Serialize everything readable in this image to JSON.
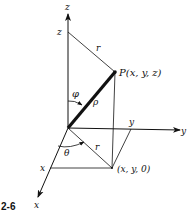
{
  "figure": {
    "number": "2-6"
  },
  "axes": {
    "z_label": "z",
    "y_label": "y",
    "x_label": "x"
  },
  "ticks": {
    "z_tick": "z",
    "y_tick": "y",
    "x_tick": "x"
  },
  "point": {
    "label": "P(x, y, z)",
    "projection_label": "(x, y, 0)"
  },
  "symbols": {
    "phi": "φ",
    "rho": "ρ",
    "theta": "θ",
    "r_upper": "r",
    "r_lower": "r"
  },
  "colors": {
    "ink": "#111111",
    "background": "#ffffff"
  }
}
